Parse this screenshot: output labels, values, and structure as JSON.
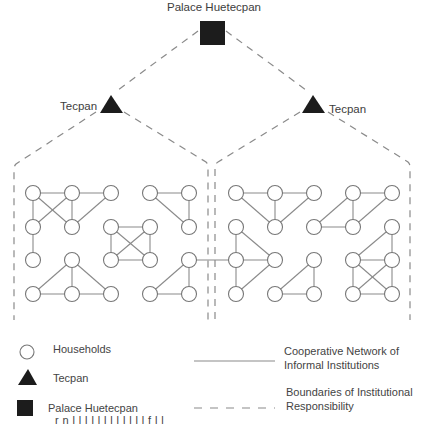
{
  "labels": {
    "palace": "Palace Huetecpan",
    "tecpan_left": "Tecpan",
    "tecpan_right": "Tecpan"
  },
  "legend": {
    "households": "Households",
    "tecpan": "Tecpan",
    "palace": "Palace Huetecpan",
    "cooperative_line1": "Cooperative Network of",
    "cooperative_line2": "Informal Institutions",
    "boundaries_line1": "Boundaries of Institutional",
    "boundaries_line2": "Responsibility"
  },
  "caption_cut": "r n     l   l  l     l     l        l  l    l       l  l    l  l   f  l    l",
  "colors": {
    "line": "#8a8a8a",
    "node_stroke": "#777777",
    "symbol_fill": "#1c1c1c"
  },
  "nodes": [
    {
      "id": "a1",
      "x": 33,
      "y": 193
    },
    {
      "id": "a2",
      "x": 72,
      "y": 193
    },
    {
      "id": "a3",
      "x": 111,
      "y": 193
    },
    {
      "id": "a4",
      "x": 33,
      "y": 227
    },
    {
      "id": "a5",
      "x": 72,
      "y": 227
    },
    {
      "id": "a6",
      "x": 33,
      "y": 260
    },
    {
      "id": "b1",
      "x": 150,
      "y": 193
    },
    {
      "id": "b2",
      "x": 189,
      "y": 193
    },
    {
      "id": "b3",
      "x": 189,
      "y": 227
    },
    {
      "id": "c1",
      "x": 111,
      "y": 227
    },
    {
      "id": "c2",
      "x": 150,
      "y": 227
    },
    {
      "id": "c3",
      "x": 111,
      "y": 260
    },
    {
      "id": "c4",
      "x": 150,
      "y": 260
    },
    {
      "id": "d1",
      "x": 72,
      "y": 260
    },
    {
      "id": "d2",
      "x": 33,
      "y": 294
    },
    {
      "id": "d3",
      "x": 72,
      "y": 294
    },
    {
      "id": "d4",
      "x": 111,
      "y": 294
    },
    {
      "id": "e1",
      "x": 189,
      "y": 260
    },
    {
      "id": "e2",
      "x": 150,
      "y": 294
    },
    {
      "id": "e3",
      "x": 189,
      "y": 294
    },
    {
      "id": "f1",
      "x": 236,
      "y": 193
    },
    {
      "id": "f2",
      "x": 275,
      "y": 193
    },
    {
      "id": "f3",
      "x": 314,
      "y": 193
    },
    {
      "id": "f4",
      "x": 275,
      "y": 227
    },
    {
      "id": "g1",
      "x": 353,
      "y": 193
    },
    {
      "id": "g2",
      "x": 392,
      "y": 193
    },
    {
      "id": "g3",
      "x": 314,
      "y": 227
    },
    {
      "id": "g4",
      "x": 353,
      "y": 227
    },
    {
      "id": "h1",
      "x": 236,
      "y": 227
    },
    {
      "id": "h2",
      "x": 236,
      "y": 260
    },
    {
      "id": "h3",
      "x": 275,
      "y": 260
    },
    {
      "id": "h4",
      "x": 236,
      "y": 294
    },
    {
      "id": "i1",
      "x": 314,
      "y": 260
    },
    {
      "id": "i2",
      "x": 275,
      "y": 294
    },
    {
      "id": "i3",
      "x": 314,
      "y": 294
    },
    {
      "id": "j1",
      "x": 392,
      "y": 227
    },
    {
      "id": "j2",
      "x": 353,
      "y": 260
    },
    {
      "id": "j3",
      "x": 392,
      "y": 260
    },
    {
      "id": "j4",
      "x": 353,
      "y": 294
    },
    {
      "id": "j5",
      "x": 392,
      "y": 294
    }
  ],
  "edges": [
    [
      "a1",
      "a2"
    ],
    [
      "a2",
      "a3"
    ],
    [
      "a1",
      "a4"
    ],
    [
      "a1",
      "a5"
    ],
    [
      "a2",
      "a4"
    ],
    [
      "a2",
      "a5"
    ],
    [
      "a3",
      "a5"
    ],
    [
      "a4",
      "a6"
    ],
    [
      "b1",
      "b2"
    ],
    [
      "b2",
      "b3"
    ],
    [
      "b1",
      "b3"
    ],
    [
      "c1",
      "c2"
    ],
    [
      "c3",
      "c4"
    ],
    [
      "c1",
      "c3"
    ],
    [
      "c2",
      "c4"
    ],
    [
      "c1",
      "c4"
    ],
    [
      "c2",
      "c3"
    ],
    [
      "d1",
      "d2"
    ],
    [
      "d1",
      "d3"
    ],
    [
      "d1",
      "d4"
    ],
    [
      "d2",
      "d3"
    ],
    [
      "d3",
      "d4"
    ],
    [
      "e1",
      "e2"
    ],
    [
      "e1",
      "e3"
    ],
    [
      "e2",
      "e3"
    ],
    [
      "e1",
      "h2"
    ],
    [
      "f1",
      "f2"
    ],
    [
      "f2",
      "f3"
    ],
    [
      "f1",
      "f4"
    ],
    [
      "f2",
      "f4"
    ],
    [
      "f3",
      "f4"
    ],
    [
      "g1",
      "g2"
    ],
    [
      "g1",
      "g3"
    ],
    [
      "g1",
      "g4"
    ],
    [
      "g2",
      "g4"
    ],
    [
      "g3",
      "g4"
    ],
    [
      "h1",
      "h2"
    ],
    [
      "h1",
      "h3"
    ],
    [
      "h2",
      "h3"
    ],
    [
      "h2",
      "h4"
    ],
    [
      "h3",
      "h4"
    ],
    [
      "i1",
      "i2"
    ],
    [
      "i1",
      "i3"
    ],
    [
      "i2",
      "i3"
    ],
    [
      "j1",
      "j2"
    ],
    [
      "j1",
      "j3"
    ],
    [
      "j2",
      "j3"
    ],
    [
      "j2",
      "j4"
    ],
    [
      "j2",
      "j5"
    ],
    [
      "j3",
      "j4"
    ],
    [
      "j3",
      "j5"
    ],
    [
      "j4",
      "j5"
    ]
  ]
}
